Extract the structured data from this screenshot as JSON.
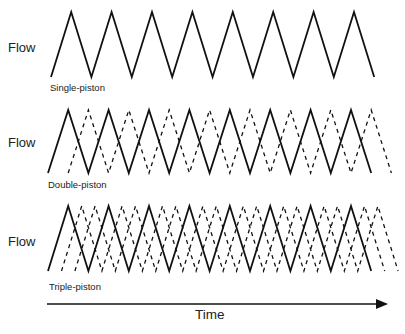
{
  "diagram": {
    "type": "pump flow waveform comparison",
    "axis": {
      "x_label": "Time",
      "arrow": {
        "x1": 47,
        "x2": 388,
        "y": 304
      }
    },
    "panels": [
      {
        "id": "single",
        "y_label": "Flow",
        "caption": "Single-piston",
        "label_pos": {
          "x": 8,
          "y": 41
        },
        "caption_pos": {
          "x": 50,
          "y": 83
        },
        "baseline_y": 77,
        "peak_y": 12,
        "x_start": 51,
        "half_period": 20.2,
        "teeth": 8,
        "phases": [
          0
        ]
      },
      {
        "id": "double",
        "y_label": "Flow",
        "caption": "Double-piston",
        "label_pos": {
          "x": 8,
          "y": 136
        },
        "caption_pos": {
          "x": 48,
          "y": 180
        },
        "baseline_y": 173,
        "peak_y": 110,
        "x_start": 48,
        "half_period": 20.2,
        "teeth": 8,
        "phases": [
          0,
          0.5
        ]
      },
      {
        "id": "triple",
        "y_label": "Flow",
        "caption": "Triple-piston",
        "label_pos": {
          "x": 8,
          "y": 235
        },
        "caption_pos": {
          "x": 49,
          "y": 282
        },
        "baseline_y": 271,
        "peak_y": 206,
        "x_start": 48,
        "half_period": 20.2,
        "teeth": 8,
        "phases": [
          0,
          0.333,
          0.667
        ]
      }
    ],
    "styles": {
      "stroke_color": "#111111",
      "solid_width": 1.8,
      "dashed_width": 1.3,
      "dash_pattern": "4,4"
    }
  }
}
